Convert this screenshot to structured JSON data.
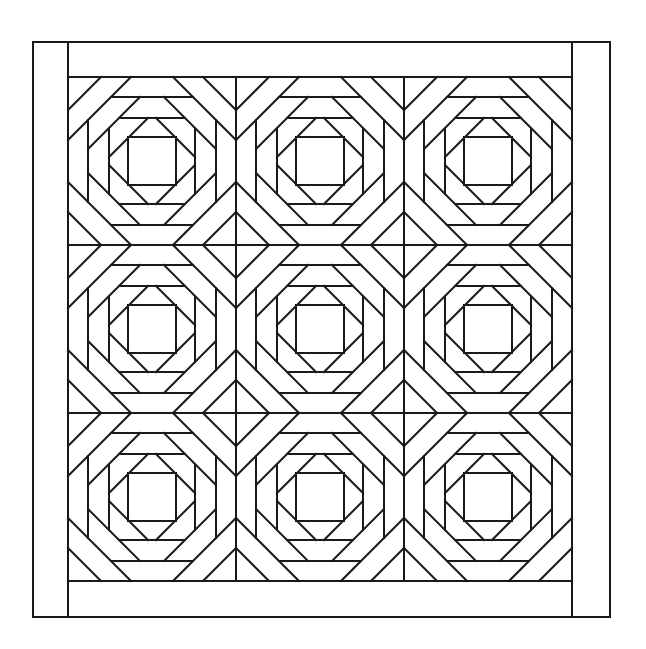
{
  "canvas": {
    "width": 646,
    "height": 649,
    "background": "#ffffff",
    "stroke": "#1a1a1a",
    "stroke_width": 2
  },
  "border": {
    "outer": {
      "x1": 33,
      "y1": 42,
      "x2": 610,
      "y2": 617
    },
    "side_strip_inner_x": [
      68,
      572
    ],
    "top_band_bottom_y": 77,
    "bottom_band_top_y": 581
  },
  "grid": {
    "origin_x": 68,
    "origin_y": 77,
    "rows": 3,
    "cols": 3,
    "block_size": 168
  },
  "block": {
    "center_square_half": 24,
    "diagonal_rings": [
      47,
      76,
      105,
      135
    ],
    "straight_rings": [
      43,
      64
    ]
  }
}
